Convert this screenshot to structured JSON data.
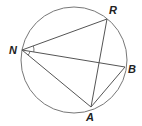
{
  "diagram": {
    "type": "inscribed-quadrilateral-with-diagonals",
    "circle": {
      "cx": 74,
      "cy": 60,
      "r": 53,
      "stroke": "#777777"
    },
    "points": {
      "N": {
        "label": "N",
        "x": 22,
        "y": 50,
        "label_x": 9,
        "label_y": 54
      },
      "R": {
        "label": "R",
        "x": 107,
        "y": 19,
        "label_x": 109,
        "label_y": 14
      },
      "B": {
        "label": "B",
        "x": 125,
        "y": 67,
        "label_x": 128,
        "label_y": 73
      },
      "A": {
        "label": "A",
        "x": 91,
        "y": 107,
        "label_x": 86,
        "label_y": 121
      }
    },
    "segments": [
      [
        "N",
        "R"
      ],
      [
        "N",
        "B"
      ],
      [
        "N",
        "A"
      ],
      [
        "R",
        "A"
      ],
      [
        "A",
        "B"
      ]
    ],
    "angle_marks": [
      {
        "vertex": "N",
        "between": [
          "R",
          "B"
        ]
      },
      {
        "vertex": "N",
        "between": [
          "B",
          "A"
        ]
      }
    ],
    "line_color": "#555555"
  }
}
